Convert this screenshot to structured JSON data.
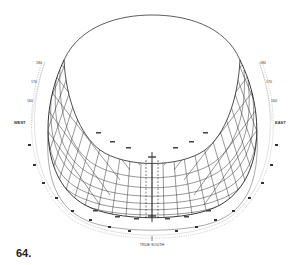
{
  "figure": {
    "number": "64.",
    "type": "sun-path diagram (perspective dome projection)",
    "labels": {
      "west": "WEST",
      "east": "EAST",
      "south": "TRUE SOUTH",
      "top_left": "180",
      "top_right": "180",
      "left_upper": "170",
      "left_mid": "160",
      "right_upper": "170",
      "right_mid": "160"
    },
    "outer_scale_left": [
      "80",
      "70",
      "60",
      "50",
      "40",
      "30",
      "20",
      "10"
    ],
    "outer_scale_right": [
      "80",
      "70",
      "60",
      "50",
      "40",
      "30",
      "20",
      "10"
    ],
    "colors": {
      "line": "#222222",
      "grid": "#333333",
      "background": "#ffffff"
    }
  }
}
